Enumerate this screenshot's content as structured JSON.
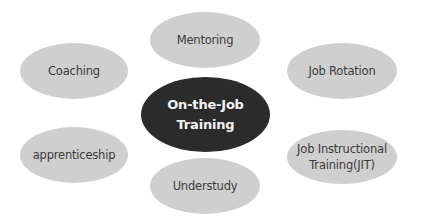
{
  "diagram": {
    "type": "hub-and-spoke",
    "center": {
      "label": "On-the-Job\nTraining",
      "color": "#2b2b2b",
      "text_color": "#f2f2f2"
    },
    "satellite_color": "#cfcfcf",
    "satellite_text_color": "#3a3a3a",
    "nodes": [
      {
        "id": "mentoring",
        "label": "Mentoring",
        "position": "top"
      },
      {
        "id": "coaching",
        "label": "Coaching",
        "position": "upper-left"
      },
      {
        "id": "job-rotation",
        "label": "Job Rotation",
        "position": "upper-right"
      },
      {
        "id": "apprenticeship",
        "label": "apprenticeship",
        "position": "lower-left"
      },
      {
        "id": "jit",
        "label": "Job Instructional\nTraining(JIT)",
        "position": "lower-right"
      },
      {
        "id": "understudy",
        "label": "Understudy",
        "position": "bottom"
      }
    ]
  }
}
